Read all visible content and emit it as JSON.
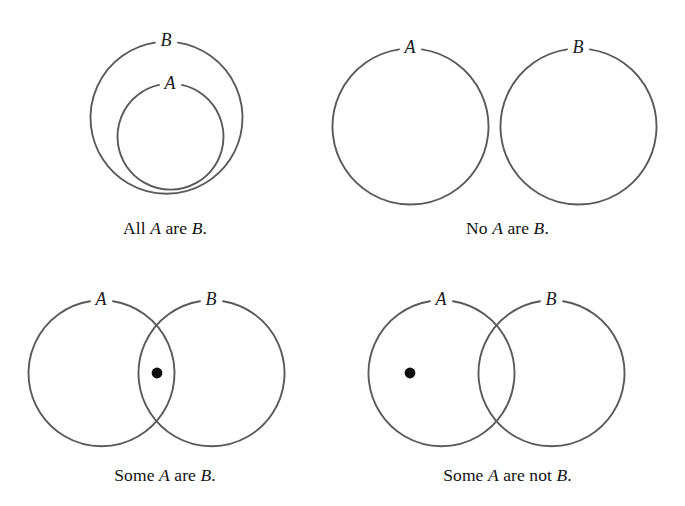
{
  "figure": {
    "background_color": "#ffffff",
    "stroke_color": "#5a5a5a",
    "dot_color": "#0d0d0d",
    "text_color": "#1a1a1a"
  },
  "panels": [
    {
      "id": "all-a-are-b",
      "caption_parts": {
        "before": "All ",
        "term1": "A",
        "middle": " are ",
        "term2": "B",
        "after": "."
      },
      "caption_text": "All A are B.",
      "labels": {
        "outer": "B",
        "inner": "A"
      },
      "relation": "inclusion",
      "has_dot": false,
      "circles": [
        {
          "name": "B",
          "cx": 166,
          "cy": 118,
          "r": 76
        },
        {
          "name": "A",
          "cx": 170,
          "cy": 137,
          "r": 53
        }
      ]
    },
    {
      "id": "no-a-are-b",
      "caption_parts": {
        "before": "No ",
        "term1": "A",
        "middle": " are ",
        "term2": "B",
        "after": "."
      },
      "caption_text": "No A are B.",
      "labels": {
        "left": "A",
        "right": "B"
      },
      "relation": "disjoint",
      "has_dot": false,
      "circles": [
        {
          "name": "A",
          "cx": 80,
          "cy": 127,
          "r": 78
        },
        {
          "name": "B",
          "cx": 248,
          "cy": 127,
          "r": 78
        }
      ]
    },
    {
      "id": "some-a-are-b",
      "caption_parts": {
        "before": "Some ",
        "term1": "A",
        "middle": " are ",
        "term2": "B",
        "after": "."
      },
      "caption_text": "Some A are B.",
      "labels": {
        "left": "A",
        "right": "B"
      },
      "relation": "overlap",
      "has_dot": true,
      "dot": {
        "cx": 157,
        "cy": 118,
        "r": 5.4,
        "region": "intersection"
      },
      "circles": [
        {
          "name": "A",
          "cx": 101,
          "cy": 118,
          "r": 73
        },
        {
          "name": "B",
          "cx": 211,
          "cy": 118,
          "r": 73
        }
      ]
    },
    {
      "id": "some-a-are-not-b",
      "caption_parts": {
        "before": "Some ",
        "term1": "A",
        "middle": " are not ",
        "term2": "B",
        "after": "."
      },
      "caption_text": "Some A are not B.",
      "labels": {
        "left": "A",
        "right": "B"
      },
      "relation": "overlap",
      "has_dot": true,
      "dot": {
        "cx": 80,
        "cy": 118,
        "r": 5.4,
        "region": "a-only"
      },
      "circles": [
        {
          "name": "A",
          "cx": 111,
          "cy": 118,
          "r": 73
        },
        {
          "name": "B",
          "cx": 221,
          "cy": 118,
          "r": 73
        }
      ]
    }
  ]
}
